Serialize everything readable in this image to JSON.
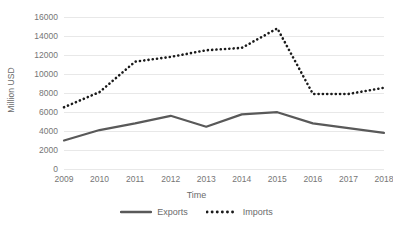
{
  "chart_data": {
    "type": "line",
    "title": "",
    "xlabel": "Time",
    "ylabel": "Million USD",
    "categories": [
      "2009",
      "2010",
      "2011",
      "2012",
      "2013",
      "2014",
      "2015",
      "2016",
      "2017",
      "2018"
    ],
    "x": [
      2009,
      2010,
      2011,
      2012,
      2013,
      2014,
      2015,
      2016,
      2017,
      2018
    ],
    "series": [
      {
        "name": "Exports",
        "style": "solid",
        "color": "#595959",
        "values": [
          3000,
          4100,
          4800,
          5600,
          4450,
          5750,
          5980,
          4800,
          4300,
          3800
        ]
      },
      {
        "name": "Imports",
        "style": "dotted",
        "color": "#1a1a1a",
        "values": [
          6500,
          8100,
          11300,
          11800,
          12500,
          12750,
          14800,
          7900,
          7900,
          8550
        ]
      }
    ],
    "ylim": [
      0,
      16000
    ],
    "yticks": [
      0,
      2000,
      4000,
      6000,
      8000,
      10000,
      12000,
      14000,
      16000
    ],
    "ytick_labels": [
      "0",
      "2000",
      "4000",
      "6000",
      "8000",
      "10000",
      "12000",
      "14000",
      "16000"
    ],
    "grid": true,
    "grid_color": "#e8e8e8",
    "legend_position": "bottom",
    "legend_entries": [
      "Exports",
      "Imports"
    ],
    "background": "#ffffff"
  }
}
